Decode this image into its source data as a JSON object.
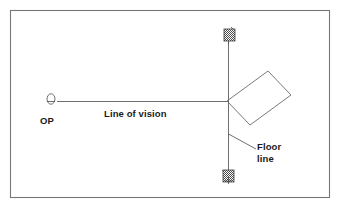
{
  "figure": {
    "kind": "perspective-plan-diagram",
    "background_color": "#ffffff",
    "line_color": "#4a4a4a",
    "frame_color": "#777777",
    "text_color": "#1a1a1a",
    "frame": {
      "x": 10,
      "y": 10,
      "width": 320,
      "height": 188
    }
  },
  "labels": {
    "observer_point": "OP",
    "line_of_vision": "Line of vision",
    "floor_line_1": "Floor",
    "floor_line_2": "line"
  },
  "elements": {
    "observer_symbol": {
      "name": "observer-head-symbol",
      "cx": 51,
      "cy": 99,
      "rx": 4.0,
      "ry": 5.2
    },
    "line_of_vision": {
      "name": "line-of-vision",
      "x1": 57,
      "y1": 101,
      "x2": 228,
      "y2": 101
    },
    "floor_line": {
      "name": "floor-line-vertical",
      "x1": 228,
      "y1": 42,
      "x2": 228,
      "y2": 176
    },
    "picture_plane_rect": {
      "name": "tilted-rectangle",
      "points": "227,101 268,71 291,95 250,125"
    },
    "leader_line": {
      "name": "floor-line-leader",
      "x1": 228,
      "y1": 134,
      "x2": 256,
      "y2": 149
    },
    "marker_top": {
      "name": "hatched-marker-top",
      "x": 224,
      "y": 29,
      "width": 11,
      "height": 12
    },
    "marker_bottom": {
      "name": "hatched-marker-bottom",
      "x": 223,
      "y": 170,
      "width": 11,
      "height": 12
    }
  }
}
